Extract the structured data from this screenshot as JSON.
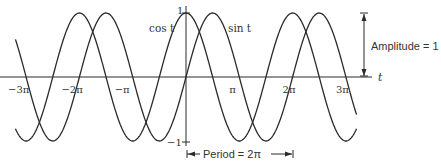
{
  "figure": {
    "curves": [
      {
        "name": "cos",
        "label": "cos t"
      },
      {
        "name": "sin",
        "label": "sin t"
      }
    ],
    "axis": {
      "t_label": "t",
      "y_top_label": "1",
      "y_bottom_label": "−1",
      "ticks": [
        {
          "value": -3,
          "label": "−3π"
        },
        {
          "value": -2,
          "label": "−2π"
        },
        {
          "value": -1,
          "label": "−π"
        },
        {
          "value": 1,
          "label": "π"
        },
        {
          "value": 2,
          "label": "2π"
        },
        {
          "value": 3,
          "label": "3π"
        }
      ]
    },
    "annotations": {
      "amplitude": "Amplitude = 1",
      "period": "Period = 2π"
    },
    "colors": {
      "line": "#2a2a2a",
      "text": "#333333"
    }
  },
  "chart_data": {
    "type": "line",
    "title": "",
    "xlabel": "t",
    "ylabel": "",
    "xlim": [
      -3.2,
      3.2
    ],
    "x_units": "pi",
    "ylim": [
      -1,
      1
    ],
    "grid": false,
    "series": [
      {
        "name": "cos t",
        "function": "cos(t)"
      },
      {
        "name": "sin t",
        "function": "sin(t)"
      }
    ],
    "tick_labels": [
      "−3π",
      "−2π",
      "−π",
      "π",
      "2π",
      "3π"
    ],
    "annotations": [
      "Amplitude = 1",
      "Period = 2π"
    ]
  }
}
